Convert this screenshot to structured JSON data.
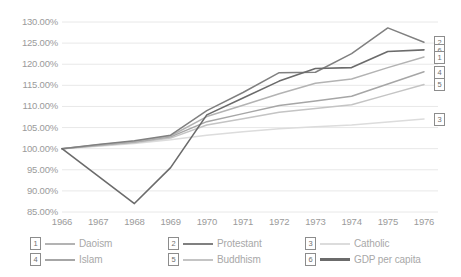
{
  "chart_data": {
    "type": "line",
    "title": "",
    "xlabel": "",
    "ylabel": "",
    "x": [
      1966,
      1967,
      1968,
      1969,
      1970,
      1971,
      1972,
      1973,
      1974,
      1975,
      1976
    ],
    "categories": [
      "1966",
      "1967",
      "1968",
      "1969",
      "1970",
      "1971",
      "1972",
      "1973",
      "1974",
      "1975",
      "1976"
    ],
    "ylim": [
      85,
      130
    ],
    "ytick_labels": [
      "130.00%",
      "125.00%",
      "120.00%",
      "115.00%",
      "110.00%",
      "105.00%",
      "100.00%",
      "95.00%",
      "90.00%",
      "85.00%"
    ],
    "ytick_values": [
      130,
      125,
      120,
      115,
      110,
      105,
      100,
      95,
      90,
      85
    ],
    "grid": true,
    "legend_position": "bottom",
    "value_format": "percent",
    "series": [
      {
        "key": "1",
        "name": "Daoism",
        "color": "#b3b3b3",
        "end_value": 121.7,
        "values": [
          100.0,
          100.9,
          101.7,
          103.0,
          107.6,
          110.3,
          113.0,
          115.5,
          116.5,
          119.2,
          121.7
        ]
      },
      {
        "key": "2",
        "name": "Protestant",
        "color": "#808080",
        "end_value": 125.2,
        "values": [
          100.0,
          101.0,
          101.9,
          103.2,
          109.0,
          113.3,
          118.0,
          118.1,
          122.5,
          128.6,
          125.2
        ]
      },
      {
        "key": "3",
        "name": "Catholic",
        "color": "#dcdcdc",
        "end_value": 107.0,
        "values": [
          100.0,
          100.6,
          101.2,
          102.1,
          103.2,
          104.0,
          104.7,
          105.2,
          105.6,
          106.3,
          107.0
        ]
      },
      {
        "key": "4",
        "name": "Islam",
        "color": "#a6a6a6",
        "end_value": 118.2,
        "values": [
          100.0,
          100.8,
          101.6,
          102.8,
          106.4,
          108.3,
          110.2,
          111.3,
          112.4,
          115.3,
          118.2
        ]
      },
      {
        "key": "5",
        "name": "Buddhism",
        "color": "#c4c4c4",
        "end_value": 115.2,
        "values": [
          100.0,
          100.7,
          101.4,
          102.5,
          105.6,
          107.1,
          108.6,
          109.5,
          110.4,
          112.8,
          115.2
        ]
      },
      {
        "key": "6",
        "name": "GDP per capita",
        "color": "#6b6b6b",
        "end_value": 123.4,
        "values": [
          100.0,
          93.5,
          87.0,
          95.5,
          108.0,
          112.0,
          116.0,
          119.0,
          119.2,
          123.0,
          123.4
        ]
      }
    ]
  },
  "legend": {
    "items": [
      {
        "key": "1",
        "label": "Daoism",
        "color": "#b3b3b3"
      },
      {
        "key": "2",
        "label": "Protestant",
        "color": "#808080"
      },
      {
        "key": "3",
        "label": "Catholic",
        "color": "#dcdcdc"
      },
      {
        "key": "4",
        "label": "Islam",
        "color": "#a6a6a6"
      },
      {
        "key": "5",
        "label": "Buddhism",
        "color": "#c4c4c4"
      },
      {
        "key": "6",
        "label": "GDP per capita",
        "color": "#6b6b6b"
      }
    ]
  },
  "end_markers": [
    {
      "key": "2",
      "series": "Protestant"
    },
    {
      "key": "6",
      "series": "GDP per capita"
    },
    {
      "key": "1",
      "series": "Daoism"
    },
    {
      "key": "4",
      "series": "Islam"
    },
    {
      "key": "5",
      "series": "Buddhism"
    },
    {
      "key": "3",
      "series": "Catholic"
    }
  ],
  "colors": {
    "grid": "#e8e8e8",
    "tick_text": "#9b9b9b",
    "legend_text": "#a8a8a8",
    "background": "#ffffff"
  }
}
